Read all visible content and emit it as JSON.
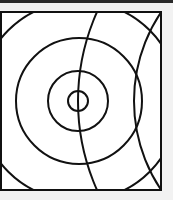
{
  "colors": {
    "background": "#f2f2f2",
    "top_band": "#2a2a2a",
    "canvas": "#ffffff",
    "stroke": "#111111"
  },
  "diagram": {
    "frame": {
      "x": 1,
      "y": 12,
      "width": 160,
      "height": 178
    },
    "stroke_width": 2,
    "concentric_circles": [
      {
        "cx": 78,
        "cy": 101,
        "r": 10
      },
      {
        "cx": 78,
        "cy": 101,
        "r": 30
      },
      {
        "cx": 79,
        "cy": 101,
        "r": 63
      },
      {
        "cx": 79,
        "cy": 101,
        "r": 100
      }
    ],
    "arcs": [
      {
        "cx": 296,
        "cy": 101,
        "r": 218
      },
      {
        "cx": 293,
        "cy": 101,
        "r": 159
      }
    ]
  }
}
